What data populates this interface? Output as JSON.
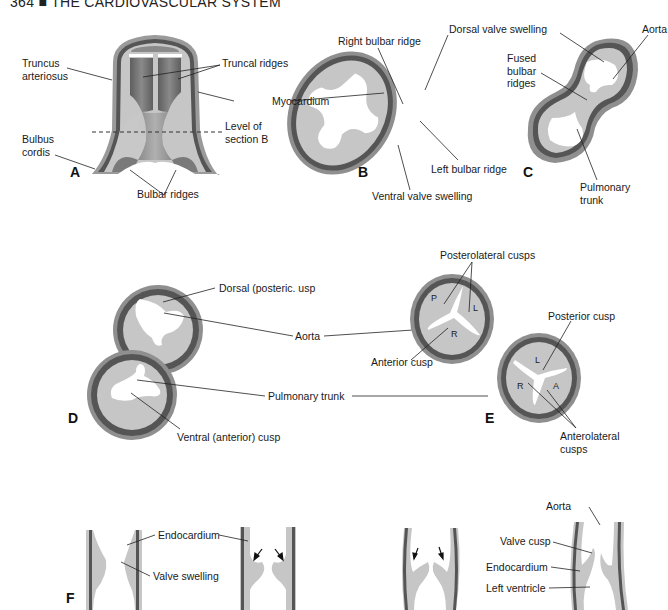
{
  "header": {
    "page_number": "364",
    "separator": "■",
    "title": "THE CARDIOVASCULAR SYSTEM"
  },
  "colors": {
    "tissue": "#c8c8c8",
    "myocardium": "#5a5a5a",
    "outer_wall": "#9a9a9a",
    "lumen": "#ffffff",
    "dark_lumen": "#6e6e6e"
  },
  "panels": {
    "A": {
      "letter": "A",
      "labels": {
        "truncus_1": "Truncus",
        "truncus_2": "arteriosus",
        "truncal_ridges": "Truncal ridges",
        "myocardium": "Myocardium",
        "level_1": "Level of",
        "level_2": "section B",
        "bulbus_1": "Bulbus",
        "bulbus_2": "cordis",
        "bulbar_ridges": "Bulbar ridges"
      }
    },
    "B": {
      "letter": "B",
      "labels": {
        "right_bulbar": "Right bulbar ridge",
        "left_bulbar": "Left bulbar ridge",
        "ventral_valve": "Ventral valve swelling"
      }
    },
    "C": {
      "letter": "C",
      "labels": {
        "dorsal_valve": "Dorsal valve swelling",
        "aorta": "Aorta",
        "fused_1": "Fused",
        "fused_2": "bulbar",
        "fused_3": "ridges",
        "pulmonary_1": "Pulmonary",
        "pulmonary_2": "trunk"
      }
    },
    "D": {
      "letter": "D",
      "labels": {
        "dorsal_cusp": "Dorsal (posteric.  usp",
        "aorta": "Aorta",
        "pulmonary": "Pulmonary trunk",
        "ventral_cusp": "Ventral (anterior) cusp"
      }
    },
    "E": {
      "letter": "E",
      "labels": {
        "posterolateral": "Posterolateral cusps",
        "anterior_cusp": "Anterior cusp",
        "posterior_cusp": "Posterior cusp",
        "anterolateral_1": "Anterolateral",
        "anterolateral_2": "cusps"
      },
      "upper_cusps": [
        "P",
        "L",
        "R"
      ],
      "lower_cusps": [
        "L",
        "R",
        "A"
      ]
    },
    "F": {
      "letter": "F",
      "labels": {
        "endocardium_1": "Endocardium",
        "valve_swelling": "Valve swelling",
        "aorta": "Aorta",
        "valve_cusp": "Valve cusp",
        "endocardium_2": "Endocardium",
        "left_ventricle": "Left ventricle"
      }
    }
  }
}
